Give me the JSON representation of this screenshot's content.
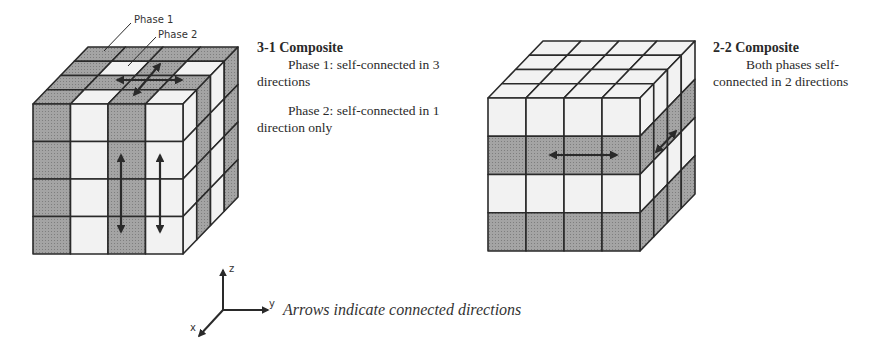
{
  "colors": {
    "gray": "#9a9a9a",
    "white": "#f2f2f2",
    "line": "#2a2a2a",
    "arrow": "#2a2a2a"
  },
  "labels": {
    "phase1": "Phase 1",
    "phase2": "Phase 2"
  },
  "composite_31": {
    "title": "3-1 Composite",
    "phase1_line1": "Phase 1: self-connected in 3",
    "phase1_line2": "directions",
    "phase2_line1": "Phase 2: self-connected in 1",
    "phase2_line2": "direction only"
  },
  "composite_22": {
    "title": "2-2 Composite",
    "line1": "Both phases self-",
    "line2": "connected in 2 directions"
  },
  "axes": {
    "x": "x",
    "y": "y",
    "z": "z"
  },
  "caption": "Arrows indicate connected directions",
  "cubes": [
    {
      "id": "cube-3-1",
      "front": {
        "x": 33,
        "y": 104,
        "w": 150,
        "h": 150
      },
      "depth": {
        "dx": 55,
        "dy": -57
      },
      "n": 4,
      "front_pattern": [
        [
          "g",
          "w",
          "g",
          "w"
        ],
        [
          "g",
          "w",
          "g",
          "w"
        ],
        [
          "g",
          "w",
          "g",
          "w"
        ],
        [
          "g",
          "w",
          "g",
          "w"
        ]
      ],
      "top_pattern_back_to_front": [
        [
          "g",
          "g",
          "g",
          "g"
        ],
        [
          "g",
          "w",
          "g",
          "w"
        ],
        [
          "g",
          "g",
          "g",
          "g"
        ],
        [
          "g",
          "w",
          "g",
          "w"
        ]
      ],
      "side_pattern_front_to_back": [
        [
          "w",
          "g",
          "w",
          "g"
        ],
        [
          "w",
          "g",
          "w",
          "g"
        ],
        [
          "w",
          "g",
          "w",
          "g"
        ],
        [
          "w",
          "g",
          "w",
          "g"
        ]
      ],
      "arrows": [
        {
          "x1": 121,
          "y1": 155,
          "x2": 121,
          "y2": 232
        },
        {
          "x1": 160,
          "y1": 155,
          "x2": 160,
          "y2": 232
        },
        {
          "x1": 117,
          "y1": 80,
          "x2": 182,
          "y2": 80
        },
        {
          "x1": 134,
          "y1": 95,
          "x2": 160,
          "y2": 64
        }
      ]
    },
    {
      "id": "cube-2-2",
      "front": {
        "x": 488,
        "y": 98,
        "w": 152,
        "h": 153
      },
      "depth": {
        "dx": 55,
        "dy": -57
      },
      "n": 4,
      "front_pattern": [
        [
          "w",
          "w",
          "w",
          "w"
        ],
        [
          "g",
          "g",
          "g",
          "g"
        ],
        [
          "w",
          "w",
          "w",
          "w"
        ],
        [
          "g",
          "g",
          "g",
          "g"
        ]
      ],
      "top_pattern_back_to_front": [
        [
          "w",
          "w",
          "w",
          "w"
        ],
        [
          "w",
          "w",
          "w",
          "w"
        ],
        [
          "w",
          "w",
          "w",
          "w"
        ],
        [
          "w",
          "w",
          "w",
          "w"
        ]
      ],
      "side_pattern_front_to_back": [
        [
          "w",
          "w",
          "w",
          "w"
        ],
        [
          "g",
          "g",
          "g",
          "g"
        ],
        [
          "w",
          "w",
          "w",
          "w"
        ],
        [
          "g",
          "g",
          "g",
          "g"
        ]
      ],
      "arrows": [
        {
          "x1": 550,
          "y1": 155,
          "x2": 617,
          "y2": 155
        },
        {
          "x1": 656,
          "y1": 152,
          "x2": 676,
          "y2": 131
        }
      ]
    }
  ],
  "leaders": [
    {
      "x1": 131,
      "y1": 23,
      "x2": 104,
      "y2": 51
    },
    {
      "x1": 156,
      "y1": 37,
      "x2": 128,
      "y2": 66
    }
  ],
  "axes_geom": {
    "origin": [
      223,
      310
    ],
    "z_tip": [
      223,
      270
    ],
    "y_tip": [
      268,
      310
    ],
    "x_tip": [
      199,
      336
    ]
  }
}
